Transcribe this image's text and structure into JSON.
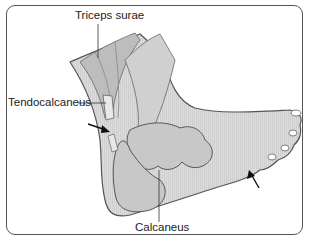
{
  "figure": {
    "type": "anatomical illustration",
    "labels": {
      "triceps_surae": "Triceps surae",
      "tendocalcaneus": "Tendocalcaneus",
      "calcaneus": "Calcaneus"
    },
    "arrows": [
      {
        "name": "posterior-heel-arrow",
        "points_to": "region anterior to tendocalcaneus"
      },
      {
        "name": "forefoot-arrow",
        "points_to": "lateral forefoot / fifth metatarsal region"
      }
    ],
    "colors": {
      "border": "#555555",
      "skin": "#d6d6d6",
      "bone": "#c8c8c8",
      "outline": "#555555",
      "text": "#222222"
    }
  }
}
